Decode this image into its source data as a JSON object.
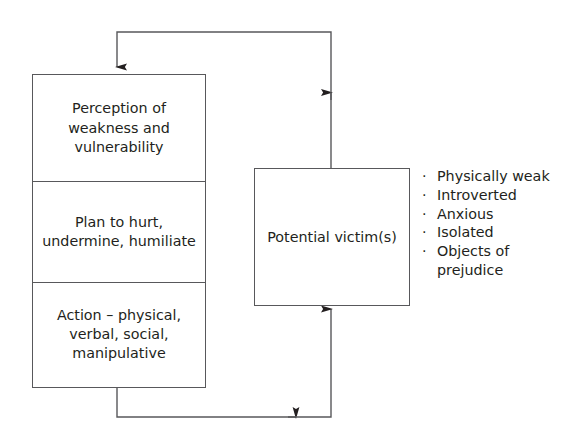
{
  "diagram": {
    "colors": {
      "stroke": "#58585b",
      "text": "#231f20",
      "background": "#ffffff"
    },
    "process_stack": {
      "name": "bully-process-stages",
      "stages": [
        {
          "id": "perception",
          "text": "Perception of\nweakness and\nvulnerability"
        },
        {
          "id": "plan",
          "text": "Plan to hurt,\nundermine, humiliate"
        },
        {
          "id": "action",
          "text": "Action – physical,\nverbal, social,\nmanipulative"
        }
      ]
    },
    "victim_box": {
      "name": "potential-victims",
      "label": "Potential victim(s)"
    },
    "traits": {
      "bullet_glyph": "·",
      "items": [
        "Physically weak",
        "Introverted",
        "Anxious",
        "Isolated",
        "Objects of prejudice"
      ]
    },
    "connectors": [
      {
        "id": "feedback-loop-top",
        "from": "potential-victims",
        "to": "perception",
        "direction": "up-left-down",
        "arrowheads": 2
      },
      {
        "id": "feedback-loop-bottom",
        "from": "action",
        "to": "potential-victims",
        "direction": "down-right-up",
        "arrowheads": 2
      }
    ]
  }
}
